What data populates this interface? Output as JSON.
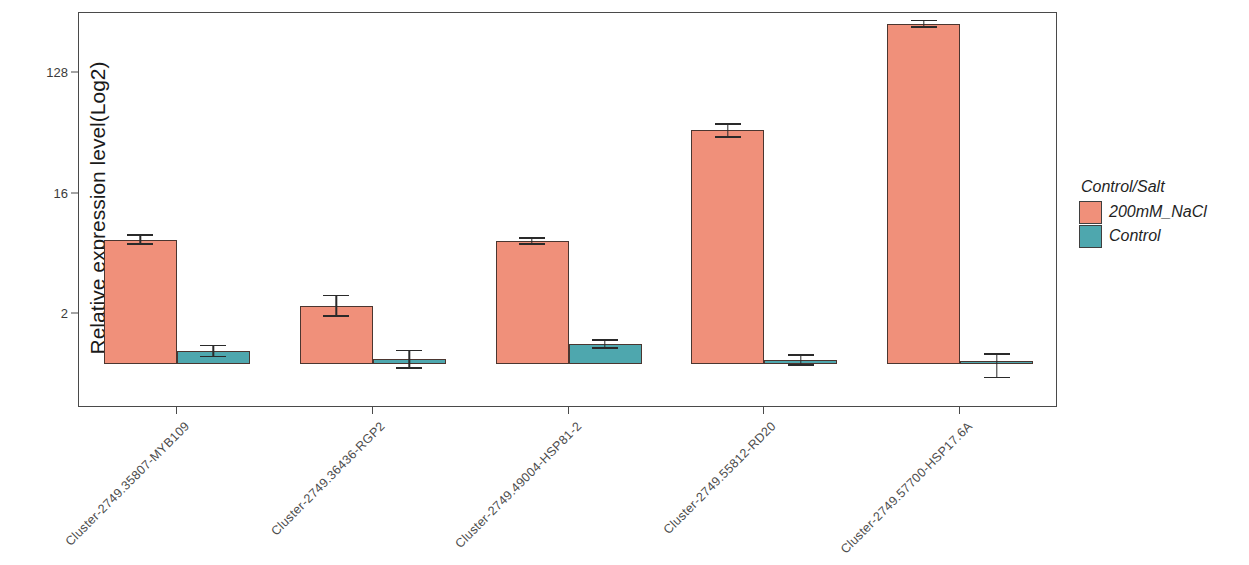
{
  "chart_data": {
    "type": "bar",
    "title": "",
    "xlabel": "",
    "ylabel": "Relative expression level(Log2)",
    "scale": "log2",
    "grid": false,
    "legend_position": "right",
    "legend_title": "Control/Salt",
    "y_ticks": [
      {
        "label": "128",
        "value": 128
      },
      {
        "label": "16",
        "value": 16
      },
      {
        "label": "2",
        "value": 2
      }
    ],
    "ylim": [
      0.5,
      420
    ],
    "categories": [
      "Cluster-2749.35807-MYB109",
      "Cluster-2749.36436-RGP2",
      "Cluster-2749.49004-HSP81-2",
      "Cluster-2749.55812-RD20",
      "Cluster-2749.57700-HSP17.6A"
    ],
    "series": [
      {
        "name": "200mM_NaCl",
        "color": "#f0907a",
        "values": [
          7.2,
          2.3,
          7.0,
          48.0,
          300.0
        ],
        "errors_low": [
          6.6,
          1.9,
          6.6,
          42.0,
          280.0
        ],
        "errors_high": [
          7.9,
          2.8,
          7.5,
          54.0,
          320.0
        ]
      },
      {
        "name": "Control",
        "color": "#4ea7ae",
        "values": [
          1.05,
          0.92,
          1.2,
          0.9,
          0.88
        ],
        "errors_low": [
          0.95,
          0.78,
          1.1,
          0.82,
          0.66
        ],
        "errors_high": [
          1.18,
          1.08,
          1.3,
          1.0,
          1.02
        ]
      }
    ]
  },
  "axis": {
    "y_title": "Relative expression level(Log2)"
  },
  "legend": {
    "title": "Control/Salt",
    "items": [
      {
        "label": "200mM_NaCl",
        "color": "#f0907a"
      },
      {
        "label": "Control",
        "color": "#4ea7ae"
      }
    ]
  }
}
